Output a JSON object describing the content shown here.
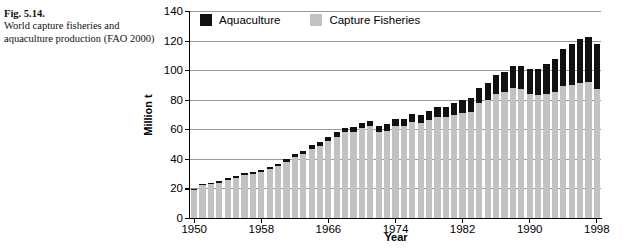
{
  "caption": {
    "figure_label": "Fig. 5.14.",
    "description": "World capture fisheries and aquaculture production (FAO 2000)"
  },
  "legend": {
    "position": "top-left-inside",
    "items": [
      {
        "label": "Aquaculture",
        "color": "#111111",
        "swatch_name": "legend-swatch-aquaculture"
      },
      {
        "label": "Capture Fisheries",
        "color": "#c2c2c2",
        "swatch_name": "legend-swatch-capture-fisheries"
      }
    ]
  },
  "chart_data": {
    "type": "bar",
    "stacked": true,
    "title": "",
    "xlabel": "Year",
    "ylabel": "Million t",
    "ylim": [
      0,
      140
    ],
    "yticks": [
      0,
      20,
      40,
      60,
      80,
      100,
      120,
      140
    ],
    "xticks": [
      1950,
      1958,
      1966,
      1974,
      1982,
      1990,
      1998
    ],
    "grid": "horizontal",
    "x": [
      1950,
      1951,
      1952,
      1953,
      1954,
      1955,
      1956,
      1957,
      1958,
      1959,
      1960,
      1961,
      1962,
      1963,
      1964,
      1965,
      1966,
      1967,
      1968,
      1969,
      1970,
      1971,
      1972,
      1973,
      1974,
      1975,
      1976,
      1977,
      1978,
      1979,
      1980,
      1981,
      1982,
      1983,
      1984,
      1985,
      1986,
      1987,
      1988,
      1989,
      1990,
      1991,
      1992,
      1993,
      1994,
      1995,
      1996,
      1997,
      1998
    ],
    "series": [
      {
        "name": "Capture Fisheries",
        "color": "#c2c2c2",
        "values": [
          19,
          22,
          23,
          24,
          26,
          27,
          29,
          30,
          31,
          33,
          35,
          38,
          41,
          43,
          47,
          49,
          52,
          55,
          58,
          58,
          61,
          62,
          58,
          59,
          62,
          62,
          65,
          64,
          66,
          68,
          68,
          70,
          71,
          72,
          78,
          80,
          84,
          85,
          88,
          87,
          84,
          83,
          84,
          85,
          89,
          90,
          91,
          92,
          87
        ]
      },
      {
        "name": "Aquaculture",
        "color": "#111111",
        "values": [
          0.6,
          0.7,
          0.8,
          0.9,
          1.0,
          1.1,
          1.2,
          1.3,
          1.4,
          1.6,
          1.7,
          1.9,
          2.0,
          2.2,
          2.4,
          2.6,
          2.8,
          3.0,
          3.2,
          3.4,
          3.6,
          3.8,
          4.0,
          4.4,
          4.8,
          5.2,
          5.6,
          6.0,
          6.4,
          7.0,
          7.4,
          8.0,
          8.6,
          9.4,
          10.2,
          11.4,
          12.6,
          14.0,
          15.0,
          16.0,
          16.8,
          18.0,
          20.0,
          22.5,
          25.0,
          27.5,
          30.0,
          30.5,
          30.5
        ]
      }
    ]
  }
}
